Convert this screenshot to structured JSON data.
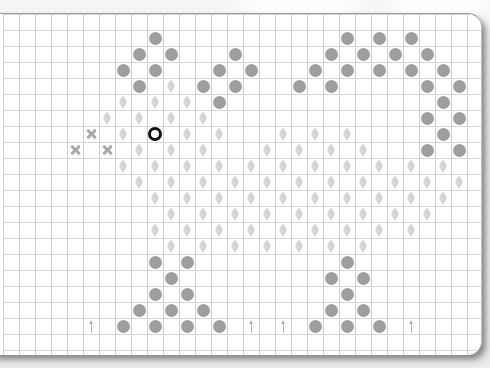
{
  "chart_data": {
    "type": "symbol-grid",
    "grid": {
      "cell_px": 16,
      "origin_x": 3,
      "origin_y": 13,
      "columns": 30,
      "rows": 21
    },
    "colors": {
      "circle": "#9e9e9e",
      "diamond": "#d4d4d4",
      "ring": "#111111",
      "cross": "#a8a8a8",
      "arrow": "#b3b3b3",
      "grid_line": "#d2d2d2",
      "paper": "#ffffff"
    },
    "symbols": {
      "circle": [
        [
          9,
          1
        ],
        [
          21,
          1
        ],
        [
          23,
          1
        ],
        [
          25,
          1
        ],
        [
          8,
          2
        ],
        [
          10,
          2
        ],
        [
          14,
          2
        ],
        [
          20,
          2
        ],
        [
          22,
          2
        ],
        [
          24,
          2
        ],
        [
          26,
          2
        ],
        [
          7,
          3
        ],
        [
          9,
          3
        ],
        [
          13,
          3
        ],
        [
          15,
          3
        ],
        [
          19,
          3
        ],
        [
          21,
          3
        ],
        [
          23,
          3
        ],
        [
          25,
          3
        ],
        [
          27,
          3
        ],
        [
          8,
          4
        ],
        [
          12,
          4
        ],
        [
          14,
          4
        ],
        [
          18,
          4
        ],
        [
          20,
          4
        ],
        [
          26,
          4
        ],
        [
          28,
          4
        ],
        [
          13,
          5
        ],
        [
          27,
          5
        ],
        [
          26,
          6
        ],
        [
          28,
          6
        ],
        [
          27,
          7
        ],
        [
          26,
          8
        ],
        [
          28,
          8
        ],
        [
          9,
          15
        ],
        [
          11,
          15
        ],
        [
          21,
          15
        ],
        [
          10,
          16
        ],
        [
          20,
          16
        ],
        [
          22,
          16
        ],
        [
          9,
          17
        ],
        [
          11,
          17
        ],
        [
          21,
          17
        ],
        [
          8,
          18
        ],
        [
          10,
          18
        ],
        [
          12,
          18
        ],
        [
          20,
          18
        ],
        [
          22,
          18
        ],
        [
          7,
          19
        ],
        [
          9,
          19
        ],
        [
          11,
          19
        ],
        [
          13,
          19
        ],
        [
          19,
          19
        ],
        [
          21,
          19
        ],
        [
          23,
          19
        ]
      ],
      "diamond": [
        [
          10,
          4
        ],
        [
          7,
          5
        ],
        [
          9,
          5
        ],
        [
          11,
          5
        ],
        [
          6,
          6
        ],
        [
          8,
          6
        ],
        [
          10,
          6
        ],
        [
          12,
          6
        ],
        [
          7,
          7
        ],
        [
          11,
          7
        ],
        [
          13,
          7
        ],
        [
          17,
          7
        ],
        [
          19,
          7
        ],
        [
          21,
          7
        ],
        [
          8,
          8
        ],
        [
          10,
          8
        ],
        [
          12,
          8
        ],
        [
          16,
          8
        ],
        [
          18,
          8
        ],
        [
          20,
          8
        ],
        [
          22,
          8
        ],
        [
          7,
          9
        ],
        [
          9,
          9
        ],
        [
          11,
          9
        ],
        [
          13,
          9
        ],
        [
          15,
          9
        ],
        [
          17,
          9
        ],
        [
          19,
          9
        ],
        [
          21,
          9
        ],
        [
          23,
          9
        ],
        [
          25,
          9
        ],
        [
          27,
          9
        ],
        [
          8,
          10
        ],
        [
          10,
          10
        ],
        [
          12,
          10
        ],
        [
          14,
          10
        ],
        [
          16,
          10
        ],
        [
          18,
          10
        ],
        [
          20,
          10
        ],
        [
          22,
          10
        ],
        [
          24,
          10
        ],
        [
          26,
          10
        ],
        [
          28,
          10
        ],
        [
          9,
          11
        ],
        [
          11,
          11
        ],
        [
          13,
          11
        ],
        [
          15,
          11
        ],
        [
          17,
          11
        ],
        [
          19,
          11
        ],
        [
          21,
          11
        ],
        [
          23,
          11
        ],
        [
          25,
          11
        ],
        [
          27,
          11
        ],
        [
          10,
          12
        ],
        [
          12,
          12
        ],
        [
          14,
          12
        ],
        [
          16,
          12
        ],
        [
          18,
          12
        ],
        [
          20,
          12
        ],
        [
          22,
          12
        ],
        [
          24,
          12
        ],
        [
          26,
          12
        ],
        [
          9,
          13
        ],
        [
          11,
          13
        ],
        [
          13,
          13
        ],
        [
          15,
          13
        ],
        [
          17,
          13
        ],
        [
          19,
          13
        ],
        [
          21,
          13
        ],
        [
          23,
          13
        ],
        [
          25,
          13
        ],
        [
          10,
          14
        ],
        [
          12,
          14
        ],
        [
          14,
          14
        ],
        [
          16,
          14
        ],
        [
          18,
          14
        ],
        [
          20,
          14
        ],
        [
          22,
          14
        ]
      ],
      "ring": [
        [
          9,
          7
        ]
      ],
      "cross": [
        [
          5,
          7
        ],
        [
          4,
          8
        ],
        [
          6,
          8
        ]
      ],
      "arrow": [
        [
          5,
          19
        ],
        [
          15,
          19
        ],
        [
          17,
          19
        ],
        [
          25,
          19
        ]
      ]
    }
  }
}
